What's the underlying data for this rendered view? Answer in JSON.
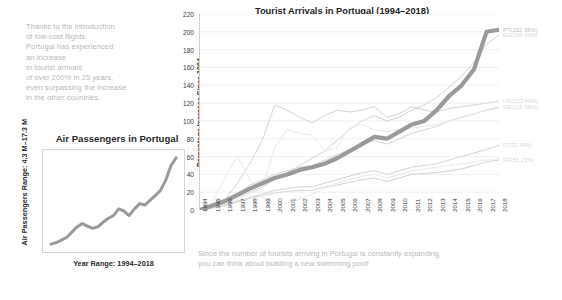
{
  "intro": {
    "lines": [
      "Thanks to the introduction",
      "of low-cost flights,",
      "Portugal has experienced",
      "an increase",
      "in tourist arrivals",
      "of over 200% in 25 years,",
      "even surpassing the increase",
      "in the other countries."
    ]
  },
  "caption": {
    "lines": [
      "Since the number of tourists arriving in Portugal is constantly expanding,",
      "you can think about building a new swimming pool!"
    ]
  },
  "colors": {
    "highlight": "#9a9a9a",
    "muted": "#c8c8c8",
    "faint": "#e2e2e2",
    "text": "#2b2b2b",
    "soft_text": "#b9b9b9"
  },
  "chart_data": [
    {
      "id": "main",
      "type": "line",
      "title": "Tourist Arrivals in Portugal (1994–2018)",
      "xlabel": "",
      "ylabel": "Percentage Increase Since 1994",
      "ylim": [
        0,
        220
      ],
      "yticks": [
        0,
        20,
        40,
        60,
        80,
        100,
        120,
        140,
        160,
        180,
        200,
        220
      ],
      "grid": true,
      "legend_position": "right-end-labels",
      "x": [
        1994,
        1995,
        1996,
        1997,
        1998,
        1999,
        2000,
        2001,
        2002,
        2003,
        2004,
        2005,
        2006,
        2007,
        2008,
        2009,
        2010,
        2011,
        2012,
        2013,
        2014,
        2015,
        2016,
        2017,
        2018
      ],
      "series": [
        {
          "name": "PT",
          "label": "PT(202.36%)",
          "final_value": 202.36,
          "emphasis": true,
          "values": [
            0,
            5,
            10,
            17,
            24,
            30,
            36,
            40,
            45,
            48,
            52,
            58,
            66,
            74,
            82,
            80,
            88,
            96,
            100,
            112,
            128,
            140,
            158,
            200,
            202.36
          ]
        },
        {
          "name": "ES",
          "label": "ES(196.43%)",
          "final_value": 196.43,
          "emphasis": false,
          "values": [
            0,
            4,
            8,
            14,
            20,
            26,
            34,
            42,
            50,
            58,
            66,
            78,
            90,
            100,
            106,
            100,
            104,
            112,
            118,
            126,
            138,
            150,
            166,
            186,
            196.43
          ]
        },
        {
          "name": "US",
          "label": "US(122.49%)",
          "final_value": 122.49,
          "emphasis": false,
          "values": [
            0,
            6,
            12,
            30,
            52,
            78,
            118,
            112,
            104,
            98,
            106,
            112,
            110,
            112,
            116,
            104,
            108,
            116,
            112,
            110,
            114,
            116,
            118,
            120,
            122.49
          ]
        },
        {
          "name": "DE",
          "label": "DE(115.98%)",
          "final_value": 115.98,
          "emphasis": false,
          "values": [
            0,
            4,
            10,
            18,
            28,
            34,
            40,
            44,
            48,
            50,
            56,
            62,
            68,
            74,
            78,
            74,
            80,
            86,
            90,
            94,
            100,
            104,
            108,
            112,
            115.98
          ]
        },
        {
          "name": "IT",
          "label": "IT(72.74%)",
          "final_value": 72.74,
          "emphasis": false,
          "values": [
            0,
            3,
            6,
            10,
            14,
            18,
            22,
            24,
            26,
            26,
            30,
            34,
            38,
            42,
            44,
            40,
            44,
            48,
            50,
            52,
            56,
            60,
            64,
            68,
            72.74
          ]
        },
        {
          "name": "FR",
          "label": "FR(56.23%)",
          "final_value": 56.23,
          "emphasis": false,
          "values": [
            0,
            2,
            5,
            9,
            13,
            16,
            19,
            21,
            22,
            22,
            26,
            28,
            31,
            34,
            36,
            32,
            36,
            40,
            41,
            42,
            44,
            46,
            50,
            54,
            56.23
          ]
        },
        {
          "name": "other-1",
          "label": "",
          "final_value": 0,
          "emphasis": false,
          "values": [
            0,
            10,
            36,
            60,
            34,
            14,
            6,
            8,
            12,
            18,
            24,
            30,
            34,
            38,
            40,
            36,
            40,
            44,
            46,
            48,
            50,
            52,
            54,
            56,
            58
          ]
        },
        {
          "name": "other-2",
          "label": "",
          "final_value": 0,
          "emphasis": false,
          "values": [
            0,
            3,
            7,
            12,
            18,
            24,
            70,
            90,
            86,
            84,
            66,
            70,
            92,
            96,
            90,
            88,
            90,
            92,
            94,
            96,
            100,
            104,
            108,
            112,
            114
          ]
        }
      ]
    },
    {
      "id": "mini",
      "type": "line",
      "title": "Air Passengers in Portugal",
      "ylabel": "Air Passengers Range: 4.3 M–17.3 M",
      "xlabel": "Year Range: 1994–2018",
      "ylim": [
        4.3,
        17.3
      ],
      "xlim": [
        1994,
        2018
      ],
      "grid": false,
      "values": [
        4.3,
        4.5,
        4.9,
        5.3,
        6.1,
        6.9,
        7.4,
        7.0,
        6.7,
        6.9,
        7.6,
        8.2,
        8.6,
        9.6,
        9.3,
        8.6,
        9.6,
        10.4,
        10.2,
        10.9,
        11.6,
        12.4,
        13.9,
        16.1,
        17.3
      ],
      "x": [
        1994,
        1995,
        1996,
        1997,
        1998,
        1999,
        2000,
        2001,
        2002,
        2003,
        2004,
        2005,
        2006,
        2007,
        2008,
        2009,
        2010,
        2011,
        2012,
        2013,
        2014,
        2015,
        2016,
        2017,
        2018
      ]
    }
  ]
}
